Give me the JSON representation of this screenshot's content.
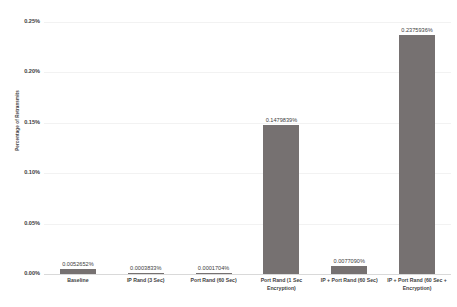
{
  "chart_data": {
    "type": "bar",
    "title": "Percentage of Retransmits",
    "subtitle": "",
    "xlabel": "",
    "ylabel": "Percentage of Retransmits",
    "ylim": [
      0,
      0.0025
    ],
    "grid": true,
    "legend": "none",
    "orientation": "vertical",
    "bar_color": "#767171",
    "gridline_color": "#f2f2f2",
    "axis_color": "#d9d9d9",
    "categories": [
      "Baseline",
      "IP Rand (3 Sec)",
      "Port Rand (60 Sec)",
      "Port Rand (1 Sec Encryption)",
      "IP + Port Rand (60 Sec)",
      "IP + Port Rand (60 Sec + Encryption)"
    ],
    "values": [
      0.0052652,
      0.0003833,
      0.0001704,
      0.1479839,
      0.007709,
      0.2375936
    ],
    "value_labels": [
      "0.0052652%",
      "0.0003833%",
      "0.0001704%",
      "0.1479839%",
      "0.0077090%",
      "0.2375936%"
    ],
    "ytick_labels": [
      "0.00%",
      "0.05%",
      "0.10%",
      "0.15%",
      "0.20%",
      "0.25%"
    ],
    "ytick_values": [
      0,
      0.05,
      0.1,
      0.15,
      0.2,
      0.25
    ],
    "units": "percent"
  },
  "axis": {
    "y_title": "Percentage of Retransmits"
  }
}
